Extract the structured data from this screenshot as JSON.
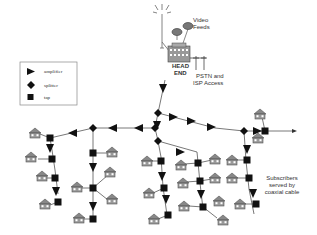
{
  "diagram": {
    "headend": {
      "label_line1": "HEAD",
      "label_line2": "END",
      "video_feeds_line1": "Video",
      "video_feeds_line2": "Feeds",
      "pstn_line1": "PSTN and",
      "pstn_line2": "ISP Access"
    },
    "legend": {
      "items": [
        {
          "symbol": "amplifier-triangle",
          "label": "amplifier"
        },
        {
          "symbol": "splitter-diamond",
          "label": "splitter"
        },
        {
          "symbol": "tap-square",
          "label": "tap"
        }
      ]
    },
    "annotation": {
      "line1": "Subscribers",
      "line2": "served by",
      "line3": "coaxial cable"
    },
    "colors": {
      "line": "#555555",
      "symbol": "#111111",
      "house": "#777777",
      "text": "#333333"
    }
  }
}
